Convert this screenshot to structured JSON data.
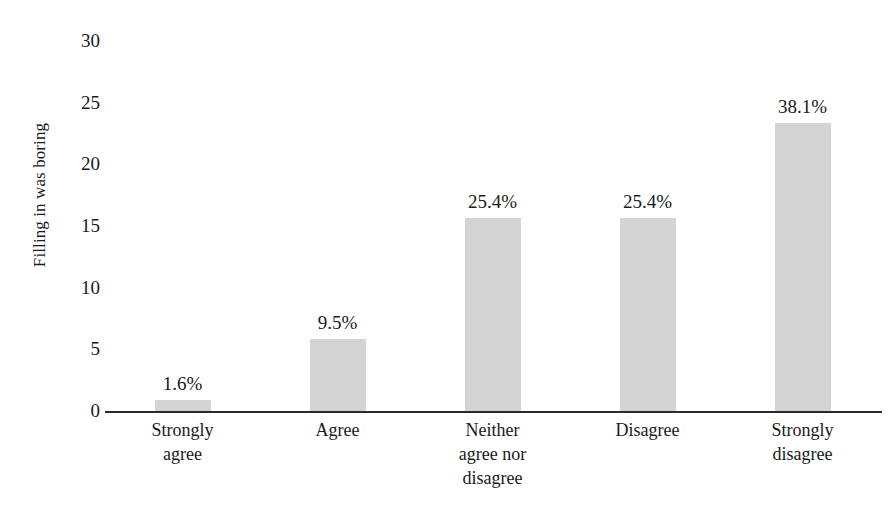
{
  "chart_data": {
    "type": "bar",
    "title": "",
    "subtitle": "",
    "xlabel": "",
    "ylabel": "Filling in was boring",
    "ylim": [
      0,
      30
    ],
    "yticks": [
      0,
      5,
      10,
      15,
      20,
      25,
      30
    ],
    "grid": false,
    "legend": "none",
    "bar_color": "#d4d4d4",
    "axis_color": "#2a2a2a",
    "text_color": "#1a1a1a",
    "categories": [
      "Strongly agree",
      "Agree",
      "Neither agree nor disagree",
      "Disagree",
      "Strongly disagree"
    ],
    "category_lines": [
      [
        "Strongly",
        "agree"
      ],
      [
        "Agree"
      ],
      [
        "Neither",
        "agree nor",
        "disagree"
      ],
      [
        "Disagree"
      ],
      [
        "Strongly",
        "disagree"
      ]
    ],
    "values": [
      1.0,
      5.9,
      15.7,
      15.7,
      23.4
    ],
    "data_labels": [
      "1.6%",
      "9.5%",
      "25.4%",
      "25.4%",
      "38.1%"
    ]
  }
}
